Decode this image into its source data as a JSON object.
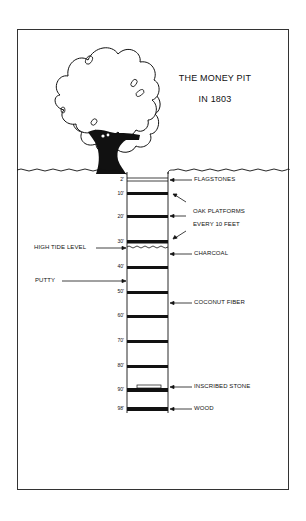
{
  "title": {
    "line1": "THE MONEY PIT",
    "line2": "IN 1803"
  },
  "depth_marks": [
    {
      "label": "2'",
      "y": 180
    },
    {
      "label": "10'",
      "y": 193
    },
    {
      "label": "20'",
      "y": 216
    },
    {
      "label": "30'",
      "y": 242
    },
    {
      "label": "40'",
      "y": 267
    },
    {
      "label": "50'",
      "y": 292
    },
    {
      "label": "60'",
      "y": 316
    },
    {
      "label": "70'",
      "y": 341
    },
    {
      "label": "80'",
      "y": 367
    },
    {
      "label": "90'",
      "y": 390
    },
    {
      "label": "98'",
      "y": 408
    }
  ],
  "right_labels": {
    "flagstones": "FLAGSTONES",
    "oak_platforms_1": "OAK PLATFORMS",
    "oak_platforms_2": "EVERY 10 FEET",
    "charcoal": "CHARCOAL",
    "coconut_fiber": "COCONUT FIBER",
    "inscribed_stone": "INSCRIBED STONE",
    "wood": "WOOD"
  },
  "left_labels": {
    "high_tide": "HIGH TIDE LEVEL",
    "putty": "PUTTY"
  },
  "colors": {
    "ink": "#111111",
    "frame": "#333333",
    "background": "#ffffff"
  }
}
